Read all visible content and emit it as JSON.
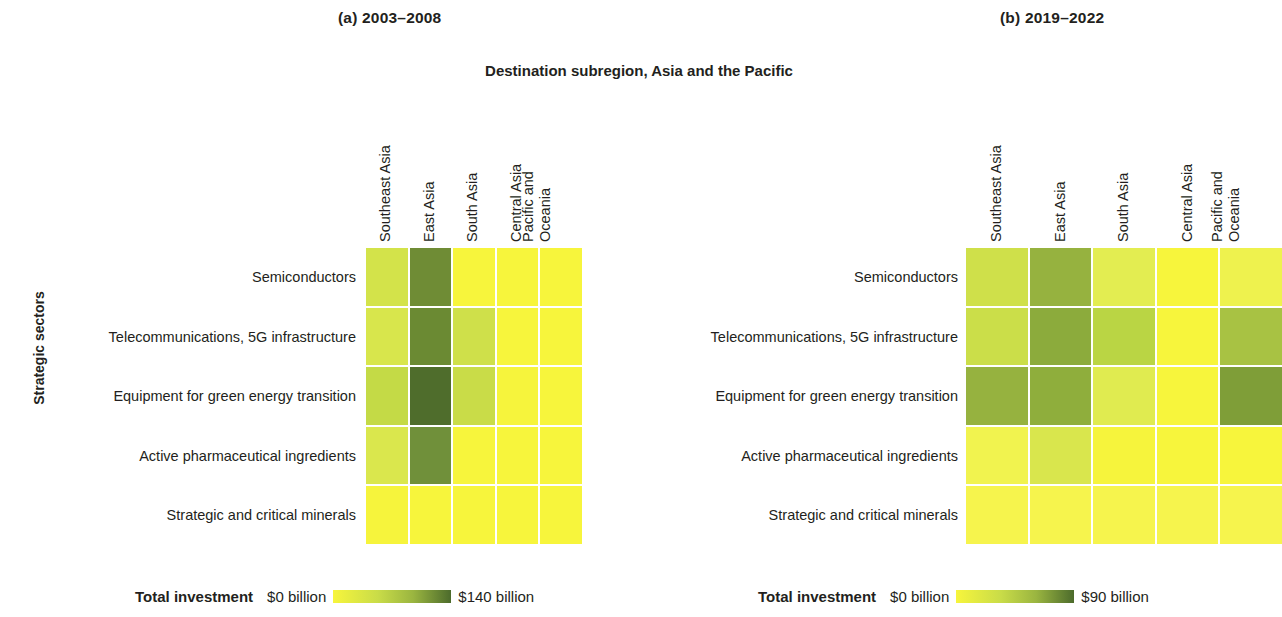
{
  "figure": {
    "top_axis_title": "Destination subregion, Asia and the Pacific",
    "left_axis_title": "Strategic sectors",
    "background": "#ffffff",
    "color_low": "#f7f53c",
    "color_high": "#4c6b2c"
  },
  "panels": [
    {
      "key": "a",
      "title": "(a) 2003–2008",
      "legend": {
        "title": "Total investment",
        "min_label": "$0 billion",
        "max_label": "$140 billion"
      }
    },
    {
      "key": "b",
      "title": "(b) 2019–2022",
      "legend": {
        "title": "Total investment",
        "min_label": "$0 billion",
        "max_label": "$90 billion"
      }
    }
  ],
  "chart_data": [
    {
      "type": "heatmap",
      "panel": "(a) 2003–2008",
      "title": "(a) 2003–2008",
      "xlabel": "Destination subregion, Asia and the Pacific",
      "ylabel": "Strategic sectors",
      "x_categories": [
        "Southeast Asia",
        "East Asia",
        "South Asia",
        "Central Asia",
        "Pacific and Oceania"
      ],
      "y_categories": [
        "Semiconductors",
        "Telecommunications, 5G infrastructure",
        "Equipment for green energy transition",
        "Active pharmaceutical ingredients",
        "Strategic and critical minerals"
      ],
      "value_unit": "billion US dollars",
      "zlim": [
        0,
        140
      ],
      "colorbar_label": "Total investment",
      "colorbar_min_label": "$0 billion",
      "colorbar_max_label": "$140 billion",
      "grid": true,
      "values": [
        [
          20,
          85,
          3,
          3,
          3
        ],
        [
          18,
          90,
          22,
          3,
          3
        ],
        [
          30,
          125,
          28,
          4,
          3
        ],
        [
          15,
          80,
          3,
          3,
          3
        ],
        [
          4,
          3,
          3,
          3,
          3
        ]
      ],
      "cell_colors": [
        [
          "#d3e34a",
          "#6f8c35",
          "#f7f53c",
          "#f7f53c",
          "#f7f53c"
        ],
        [
          "#d8e64c",
          "#6b8a33",
          "#cfe04a",
          "#f7f53c",
          "#f7f53c"
        ],
        [
          "#c4da46",
          "#4f6d2c",
          "#c9dc48",
          "#f6f43c",
          "#f7f53c"
        ],
        [
          "#dae74d",
          "#70903a",
          "#f7f53c",
          "#f7f53c",
          "#f7f53c"
        ],
        [
          "#f6f43c",
          "#f7f53c",
          "#f7f53c",
          "#f7f53c",
          "#f7f53c"
        ]
      ]
    },
    {
      "type": "heatmap",
      "panel": "(b) 2019–2022",
      "title": "(b) 2019–2022",
      "xlabel": "Destination subregion, Asia and the Pacific",
      "ylabel": "Strategic sectors",
      "x_categories": [
        "Southeast Asia",
        "East Asia",
        "South Asia",
        "Central Asia",
        "Pacific and Oceania"
      ],
      "y_categories": [
        "Semiconductors",
        "Telecommunications, 5G infrastructure",
        "Equipment for green energy transition",
        "Active pharmaceutical ingredients",
        "Strategic and critical minerals"
      ],
      "value_unit": "billion US dollars",
      "zlim": [
        0,
        90
      ],
      "colorbar_label": "Total investment",
      "colorbar_min_label": "$0 billion",
      "colorbar_max_label": "$90 billion",
      "grid": true,
      "values": [
        [
          28,
          48,
          15,
          2,
          8
        ],
        [
          30,
          52,
          32,
          3,
          38
        ],
        [
          48,
          50,
          16,
          3,
          55
        ],
        [
          8,
          22,
          4,
          4,
          4
        ],
        [
          5,
          5,
          5,
          5,
          5
        ]
      ],
      "cell_colors": [
        [
          "#cfe04a",
          "#96b23f",
          "#e3ed51",
          "#f7f53c",
          "#eef24e"
        ],
        [
          "#cbde49",
          "#8cab3c",
          "#bad544",
          "#f7f53c",
          "#a8c243"
        ],
        [
          "#96b23f",
          "#8fae3c",
          "#e0eb50",
          "#f7f53c",
          "#7f9e38"
        ],
        [
          "#f1f34f",
          "#d9e64d",
          "#f6f43c",
          "#f7f53c",
          "#f7f53c"
        ],
        [
          "#f6f44d",
          "#f6f44d",
          "#f6f44d",
          "#f6f44d",
          "#f6f44d"
        ]
      ]
    }
  ]
}
